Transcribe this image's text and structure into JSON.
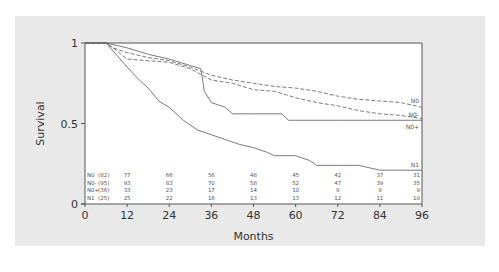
{
  "chart_data": {
    "type": "line",
    "subtype": "kaplan-meier step curves",
    "title": "",
    "xlabel": "Months",
    "ylabel": "Survival",
    "xlim": [
      0,
      96
    ],
    "ylim": [
      0,
      1
    ],
    "x_ticks": [
      0,
      12,
      24,
      36,
      48,
      60,
      72,
      84,
      96
    ],
    "x_tick_labels": [
      "0",
      "12",
      "24",
      "36",
      "48",
      "60",
      "72",
      "84",
      "96"
    ],
    "y_ticks": [
      0,
      0.5,
      1
    ],
    "y_tick_labels": [
      "0",
      "0.5",
      "1"
    ],
    "grid": false,
    "legend": "inline labels at right end of curves",
    "series": [
      {
        "name": "N0",
        "style": "dashed",
        "n": 82,
        "points": [
          [
            0,
            1
          ],
          [
            6,
            1
          ],
          [
            8,
            0.97
          ],
          [
            12,
            0.94
          ],
          [
            18,
            0.91
          ],
          [
            24,
            0.89
          ],
          [
            30,
            0.85
          ],
          [
            36,
            0.8
          ],
          [
            42,
            0.77
          ],
          [
            48,
            0.75
          ],
          [
            54,
            0.73
          ],
          [
            60,
            0.72
          ],
          [
            66,
            0.7
          ],
          [
            72,
            0.67
          ],
          [
            78,
            0.65
          ],
          [
            84,
            0.64
          ],
          [
            90,
            0.63
          ],
          [
            96,
            0.6
          ]
        ]
      },
      {
        "name": "N0-",
        "style": "dashed",
        "n": 95,
        "points": [
          [
            0,
            1
          ],
          [
            6,
            1
          ],
          [
            8,
            0.97
          ],
          [
            12,
            0.9
          ],
          [
            18,
            0.89
          ],
          [
            24,
            0.88
          ],
          [
            30,
            0.84
          ],
          [
            36,
            0.77
          ],
          [
            42,
            0.75
          ],
          [
            48,
            0.71
          ],
          [
            54,
            0.7
          ],
          [
            60,
            0.66
          ],
          [
            66,
            0.63
          ],
          [
            72,
            0.61
          ],
          [
            78,
            0.58
          ],
          [
            84,
            0.56
          ],
          [
            90,
            0.55
          ],
          [
            96,
            0.53
          ]
        ]
      },
      {
        "name": "N0+",
        "style": "solid",
        "n": 36,
        "points": [
          [
            0,
            1
          ],
          [
            6,
            1
          ],
          [
            12,
            0.97
          ],
          [
            18,
            0.93
          ],
          [
            24,
            0.9
          ],
          [
            30,
            0.86
          ],
          [
            33,
            0.84
          ],
          [
            34,
            0.7
          ],
          [
            36,
            0.63
          ],
          [
            40,
            0.6
          ],
          [
            42,
            0.56
          ],
          [
            48,
            0.56
          ],
          [
            56,
            0.56
          ],
          [
            58,
            0.52
          ],
          [
            60,
            0.52
          ],
          [
            72,
            0.52
          ],
          [
            96,
            0.52
          ]
        ]
      },
      {
        "name": "N1",
        "style": "solid",
        "n": 25,
        "points": [
          [
            0,
            1
          ],
          [
            6,
            1
          ],
          [
            12,
            0.85
          ],
          [
            15,
            0.78
          ],
          [
            18,
            0.72
          ],
          [
            21,
            0.64
          ],
          [
            24,
            0.6
          ],
          [
            28,
            0.52
          ],
          [
            32,
            0.46
          ],
          [
            36,
            0.43
          ],
          [
            40,
            0.4
          ],
          [
            44,
            0.37
          ],
          [
            48,
            0.35
          ],
          [
            52,
            0.32
          ],
          [
            54,
            0.3
          ],
          [
            60,
            0.3
          ],
          [
            64,
            0.27
          ],
          [
            66,
            0.24
          ],
          [
            72,
            0.24
          ],
          [
            78,
            0.24
          ],
          [
            84,
            0.21
          ],
          [
            96,
            0.21
          ]
        ]
      }
    ],
    "at_risk_table": {
      "times": [
        12,
        24,
        36,
        48,
        60,
        72,
        84,
        96
      ],
      "rows": [
        {
          "label": "N0",
          "total": "(82)",
          "values": [
            77,
            66,
            56,
            48,
            45,
            42,
            37,
            31
          ]
        },
        {
          "label": "N0-",
          "total": "(95)",
          "values": [
            93,
            83,
            70,
            58,
            52,
            47,
            39,
            35
          ]
        },
        {
          "label": "N0+",
          "total": "(36)",
          "values": [
            33,
            23,
            17,
            14,
            10,
            9,
            9,
            9
          ]
        },
        {
          "label": "N1",
          "total": "(25)",
          "values": [
            25,
            22,
            16,
            13,
            13,
            12,
            11,
            10
          ]
        }
      ]
    }
  },
  "colors": {
    "panel_background": "#e9e9e9",
    "plot_background": "#ffffff",
    "curve": "#7a7a7a",
    "axis": "#555555",
    "text": "#333333"
  }
}
